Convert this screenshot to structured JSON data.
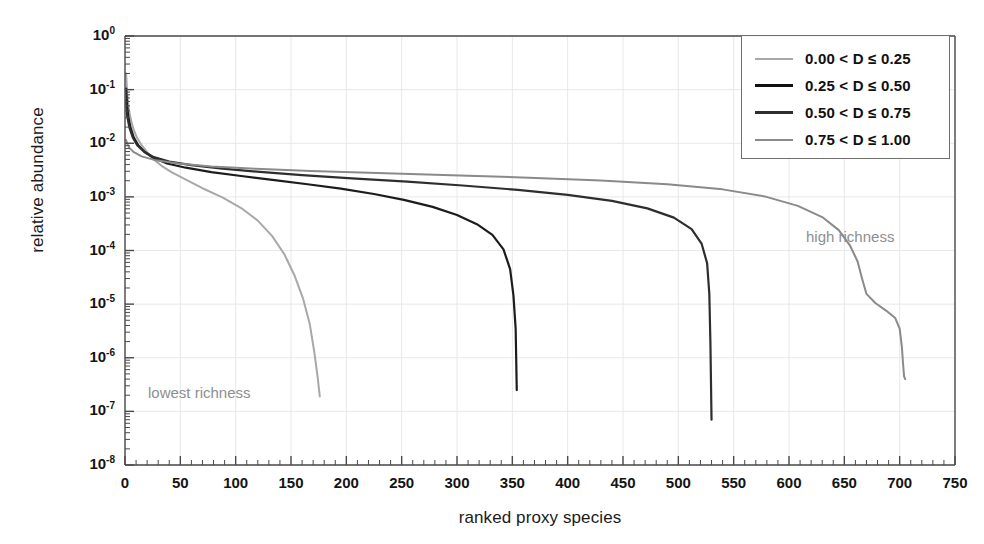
{
  "chart_data": {
    "type": "line",
    "title": "",
    "xlabel": "ranked proxy species",
    "ylabel": "relative abundance",
    "xlim": [
      0,
      750
    ],
    "ylim_log10": [
      -8,
      0
    ],
    "xticks": [
      0,
      50,
      100,
      150,
      200,
      250,
      300,
      350,
      400,
      450,
      500,
      550,
      600,
      650,
      700,
      750
    ],
    "yticks": [
      "10^0",
      "10^-1",
      "10^-2",
      "10^-3",
      "10^-4",
      "10^-5",
      "10^-6",
      "10^-7",
      "10^-8"
    ],
    "ytick_labels": [
      "10",
      "10",
      "10",
      "10",
      "10",
      "10",
      "10",
      "10",
      "10"
    ],
    "ytick_exponents": [
      "0",
      "-1",
      "-2",
      "-3",
      "-4",
      "-5",
      "-6",
      "-7",
      "-8"
    ],
    "xtick_labels": [
      "0",
      "50",
      "100",
      "150",
      "200",
      "250",
      "300",
      "350",
      "400",
      "450",
      "500",
      "550",
      "600",
      "650",
      "700",
      "750"
    ],
    "grid": true,
    "grid_color": "#e8e8e8",
    "axis_color": "#4a4a4a",
    "legend_position": "top-right",
    "minor_ticks": true,
    "series": [
      {
        "name": "0.00 < D ≤ 0.25",
        "color": "#a8a8a8",
        "width": 2.0,
        "points": [
          [
            1,
            0.2
          ],
          [
            2,
            0.085
          ],
          [
            3,
            0.052
          ],
          [
            4,
            0.037
          ],
          [
            6,
            0.024
          ],
          [
            8,
            0.0175
          ],
          [
            11,
            0.0125
          ],
          [
            15,
            0.0092
          ],
          [
            20,
            0.0068
          ],
          [
            26,
            0.005
          ],
          [
            33,
            0.0038
          ],
          [
            42,
            0.0029
          ],
          [
            55,
            0.0021
          ],
          [
            70,
            0.00145
          ],
          [
            88,
            0.00098
          ],
          [
            105,
            0.00062
          ],
          [
            120,
            0.00036
          ],
          [
            133,
            0.000185
          ],
          [
            144,
            8.5e-05
          ],
          [
            153,
            3.5e-05
          ],
          [
            161,
            1.25e-05
          ],
          [
            167,
            4.2e-06
          ],
          [
            171,
            1.3e-06
          ],
          [
            174,
            4.5e-07
          ],
          [
            176,
            1.9e-07
          ]
        ]
      },
      {
        "name": "0.25 < D ≤ 0.50",
        "color": "#1c1c1c",
        "width": 2.2,
        "points": [
          [
            1,
            0.105
          ],
          [
            2,
            0.048
          ],
          [
            3,
            0.031
          ],
          [
            5,
            0.0195
          ],
          [
            8,
            0.0128
          ],
          [
            12,
            0.0092
          ],
          [
            18,
            0.0068
          ],
          [
            26,
            0.0053
          ],
          [
            38,
            0.0042
          ],
          [
            55,
            0.0035
          ],
          [
            78,
            0.0029
          ],
          [
            105,
            0.00245
          ],
          [
            135,
            0.00205
          ],
          [
            165,
            0.00172
          ],
          [
            195,
            0.00142
          ],
          [
            225,
            0.00113
          ],
          [
            252,
            0.00088
          ],
          [
            278,
            0.00065
          ],
          [
            300,
            0.00046
          ],
          [
            318,
            0.00031
          ],
          [
            332,
            0.000195
          ],
          [
            342,
            0.000105
          ],
          [
            348,
            4.5e-05
          ],
          [
            351,
            1.45e-05
          ],
          [
            353,
            3.5e-06
          ],
          [
            354,
            2.5e-07
          ]
        ]
      },
      {
        "name": "0.50 < D ≤ 0.75",
        "color": "#2e2e2e",
        "width": 2.2,
        "points": [
          [
            1,
            0.062
          ],
          [
            2,
            0.032
          ],
          [
            4,
            0.0195
          ],
          [
            7,
            0.0128
          ],
          [
            11,
            0.0092
          ],
          [
            17,
            0.007
          ],
          [
            26,
            0.0055
          ],
          [
            40,
            0.00455
          ],
          [
            60,
            0.0039
          ],
          [
            88,
            0.00335
          ],
          [
            122,
            0.00292
          ],
          [
            160,
            0.00255
          ],
          [
            205,
            0.00222
          ],
          [
            255,
            0.00192
          ],
          [
            305,
            0.00163
          ],
          [
            355,
            0.00135
          ],
          [
            400,
            0.00109
          ],
          [
            440,
            0.00084
          ],
          [
            472,
            0.00061
          ],
          [
            496,
            0.00041
          ],
          [
            512,
            0.00025
          ],
          [
            521,
            0.000135
          ],
          [
            526,
            5.8e-05
          ],
          [
            528,
            1.55e-05
          ],
          [
            529,
            1.8e-06
          ],
          [
            530,
            7e-08
          ]
        ]
      },
      {
        "name": "0.75 < D ≤ 1.00",
        "color": "#8a8a8a",
        "width": 2.0,
        "points": [
          [
            1,
            0.0115
          ],
          [
            2,
            0.0098
          ],
          [
            4,
            0.0082
          ],
          [
            8,
            0.0068
          ],
          [
            15,
            0.0057
          ],
          [
            28,
            0.0048
          ],
          [
            48,
            0.0042
          ],
          [
            78,
            0.0037
          ],
          [
            118,
            0.00335
          ],
          [
            168,
            0.00305
          ],
          [
            228,
            0.00278
          ],
          [
            295,
            0.00252
          ],
          [
            365,
            0.00228
          ],
          [
            430,
            0.00202
          ],
          [
            490,
            0.00172
          ],
          [
            540,
            0.00138
          ],
          [
            578,
            0.00102
          ],
          [
            608,
            0.00068
          ],
          [
            630,
            0.00042
          ],
          [
            645,
            0.00024
          ],
          [
            655,
            0.000125
          ],
          [
            662,
            6.25e-05
          ],
          [
            666,
            3e-05
          ],
          [
            670,
            1.55e-05
          ],
          [
            678,
            1.05e-05
          ],
          [
            688,
            7.5e-06
          ],
          [
            696,
            5.5e-06
          ],
          [
            700,
            3.5e-06
          ],
          [
            702,
            1.6e-06
          ],
          [
            703,
            8e-07
          ],
          [
            704,
            4.5e-07
          ],
          [
            705,
            4e-07
          ]
        ]
      }
    ],
    "annotations": [
      {
        "text": "high richness",
        "x_px": 806,
        "y_px": 228,
        "color": "#8e8e8e"
      },
      {
        "text": "lowest richness",
        "x_px": 148,
        "y_px": 384,
        "color": "#8e8e8e"
      }
    ]
  },
  "legend": {
    "items": [
      {
        "label": "0.00 < D ≤ 0.25",
        "color": "#a8a8a8",
        "thickness": 2
      },
      {
        "label": "0.25 < D ≤ 0.50",
        "color": "#111111",
        "thickness": 3
      },
      {
        "label": "0.50 < D ≤ 0.75",
        "color": "#2e2e2e",
        "thickness": 3
      },
      {
        "label": "0.75 < D ≤ 1.00",
        "color": "#8a8a8a",
        "thickness": 2
      }
    ]
  }
}
